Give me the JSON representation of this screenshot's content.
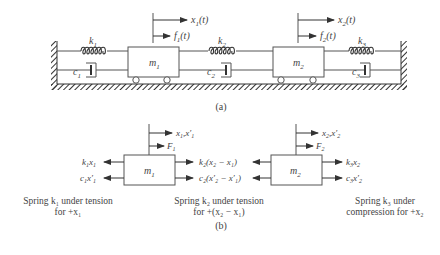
{
  "figure_a": {
    "caption": "(a)",
    "masses": [
      {
        "label": "m",
        "sub": "1",
        "disp": "x",
        "disp_sub": "1",
        "disp_arg": "(t)",
        "force": "f",
        "force_sub": "1",
        "force_arg": "(t)"
      },
      {
        "label": "m",
        "sub": "2",
        "disp": "x",
        "disp_sub": "2",
        "disp_arg": "(t)",
        "force": "f",
        "force_sub": "2",
        "force_arg": "(t)"
      }
    ],
    "springs": [
      {
        "label": "k",
        "sub": "1"
      },
      {
        "label": "k",
        "sub": "2"
      },
      {
        "label": "k",
        "sub": "3"
      }
    ],
    "dampers": [
      {
        "label": "c",
        "sub": "1"
      },
      {
        "label": "c",
        "sub": "2"
      },
      {
        "label": "c",
        "sub": "3"
      }
    ]
  },
  "figure_b": {
    "caption": "(b)",
    "m1": {
      "label": "m",
      "sub": "1",
      "disp": "x",
      "disp_sub": "1",
      "disp_rest": ",x′",
      "disp_rest_sub": "1",
      "force": "F",
      "force_sub": "1",
      "left_top": {
        "a": "k",
        "a_sub": "1",
        "b": "x",
        "b_sub": "1"
      },
      "left_bottom": {
        "a": "c",
        "a_sub": "1",
        "b": "x′",
        "b_sub": "1"
      },
      "right_top": "k₂(x₂ − x₁)",
      "right_bottom": "c₂(x′₂ − x′₁)"
    },
    "m2": {
      "label": "m",
      "sub": "2",
      "disp": "x",
      "disp_sub": "2",
      "disp_rest": ",x′",
      "disp_rest_sub": "2",
      "force": "F",
      "force_sub": "2",
      "left_top": "k₂(x₂ − x₁)",
      "left_bottom": "c₂(x′₂ − x′₁)",
      "right_top": {
        "a": "k",
        "a_sub": "3",
        "b": "x",
        "b_sub": "2"
      },
      "right_bottom": {
        "a": "c",
        "a_sub": "3",
        "b": "x′",
        "b_sub": "2"
      }
    },
    "notes": [
      {
        "line1": "Spring k₁ under tension",
        "line2": "for +x₁"
      },
      {
        "line1": "Spring k₂ under tension",
        "line2": "for +(x₂ − x₁)"
      },
      {
        "line1": "Spring k₃ under",
        "line2": "compression for +x₂"
      }
    ]
  }
}
